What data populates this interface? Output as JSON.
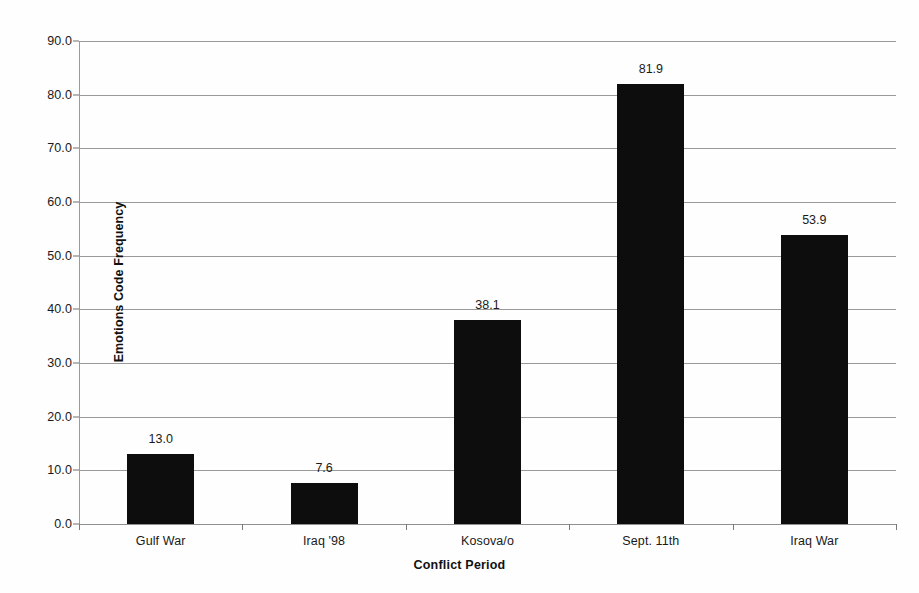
{
  "chart_data": {
    "type": "bar",
    "title": "",
    "subtitle": "",
    "xlabel": "Conflict Period",
    "ylabel": "Emotions Code Frequency",
    "categories": [
      "Gulf War",
      "Iraq '98",
      "Kosova/o",
      "Sept. 11th",
      "Iraq War"
    ],
    "values": [
      13.0,
      7.6,
      38.1,
      81.9,
      53.9
    ],
    "value_labels": [
      "13.0",
      "7.6",
      "38.1",
      "81.9",
      "53.9"
    ],
    "ylim": [
      0.0,
      90.0
    ],
    "ytick_values": [
      0.0,
      10.0,
      20.0,
      30.0,
      40.0,
      50.0,
      60.0,
      70.0,
      80.0,
      90.0
    ],
    "ytick_labels": [
      "0.0",
      "10.0",
      "20.0",
      "30.0",
      "40.0",
      "50.0",
      "60.0",
      "70.0",
      "80.0",
      "90.0"
    ],
    "grid": true,
    "legend": false,
    "legend_position": "none",
    "bar_color": "#0d0d0d",
    "gridline_color": "#9a9a9a",
    "background_color": "#fefefe",
    "text_color": "#1a1a1a"
  }
}
